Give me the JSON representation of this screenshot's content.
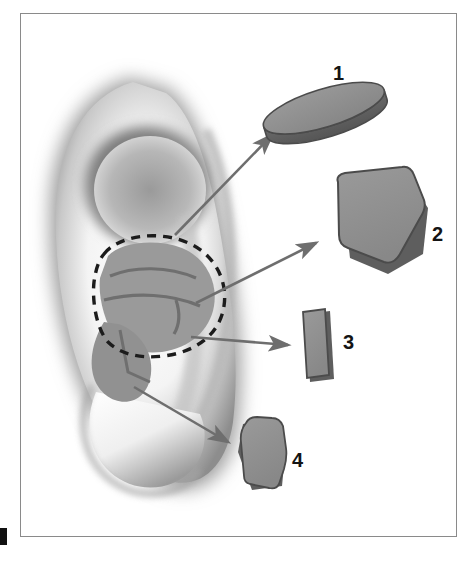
{
  "figure": {
    "kind": "anatomical-illustration",
    "background_color": "#ffffff",
    "frame_color": "#8a8a8a"
  },
  "labels": [
    {
      "id": "1",
      "text": "1",
      "describes": "oval disc graft"
    },
    {
      "id": "2",
      "text": "2",
      "describes": "large pentagonal graft"
    },
    {
      "id": "3",
      "text": "3",
      "describes": "narrow strut graft"
    },
    {
      "id": "4",
      "text": "4",
      "describes": "small tapered graft"
    }
  ],
  "grafts": [
    {
      "id": "1",
      "shape": "ellipse-disc",
      "fill": "#8e8e8e",
      "edge": "#5e5e5e",
      "outline": "#4b4b4b"
    },
    {
      "id": "2",
      "shape": "pentagon",
      "fill": "#8e8e8e",
      "edge": "#5e5e5e",
      "outline": "#4b4b4b"
    },
    {
      "id": "3",
      "shape": "narrow-rectangle",
      "fill": "#8e8e8e",
      "edge": "#5e5e5e",
      "outline": "#4b4b4b"
    },
    {
      "id": "4",
      "shape": "tapered-polygon",
      "fill": "#8e8e8e",
      "edge": "#5e5e5e",
      "outline": "#4b4b4b"
    }
  ],
  "arrows": {
    "count": 4,
    "color": "#6e6e6e",
    "targets": [
      "1",
      "2",
      "3",
      "4"
    ]
  },
  "ear": {
    "skin_tone": "#f2f2f2",
    "shadow_tone": "#6f6f6f",
    "donor_region": {
      "name": "conchal-bowl",
      "outline_style": "dashed",
      "outline_color": "#1c1c1c",
      "fill": "#9a9a9a"
    }
  },
  "colors": {
    "label_text": "#141414",
    "cartilage_fill": "#8e8e8e",
    "cartilage_shadow": "#5a5a5a",
    "arrow": "#6e6e6e"
  }
}
